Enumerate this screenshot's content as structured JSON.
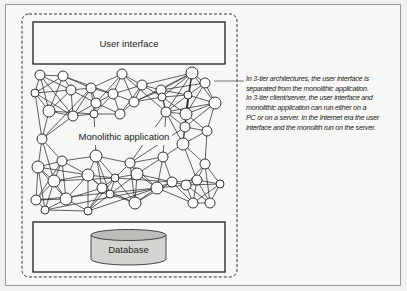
{
  "diagram": {
    "ui_box_label": "User interface",
    "monolith_label": "Monolithic application",
    "database_label": "Database",
    "annotation_lines": [
      "In 3-tier architectures, the user interface is",
      "separated from the monolithic application.",
      "In 3-tier client/server, the user interface and",
      "monolithic application can run either on a",
      "PC or on a server. In the Internet era the user",
      "interface and the monolith run on the server."
    ],
    "colors": {
      "line": "#1e1e1e",
      "node_fill": "#ffffff",
      "database_fill": "#d0d0cc",
      "database_top": "#b9b9b5",
      "background": "#f7f7f5"
    }
  }
}
